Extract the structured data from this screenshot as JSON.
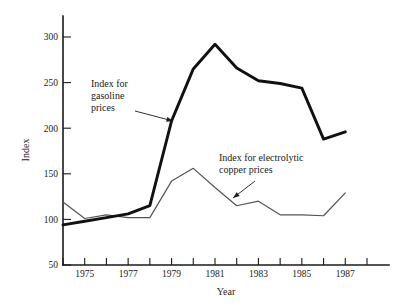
{
  "chart_data": {
    "type": "line",
    "title": "",
    "xlabel": "Year",
    "ylabel": "Index",
    "xlim": [
      1974,
      1988
    ],
    "ylim": [
      50,
      300
    ],
    "grid": false,
    "legend_position": "inline-annotations",
    "x": [
      1974,
      1975,
      1976,
      1977,
      1978,
      1979,
      1980,
      1981,
      1982,
      1983,
      1984,
      1985,
      1986,
      1987
    ],
    "xtick_values": [
      1974,
      1975,
      1976,
      1977,
      1978,
      1979,
      1980,
      1981,
      1982,
      1983,
      1984,
      1985,
      1986,
      1987,
      1988
    ],
    "xtick_labels": [
      "",
      "1975",
      "",
      "1977",
      "",
      "1979",
      "",
      "1981",
      "",
      "1983",
      "",
      "1985",
      "",
      "1987",
      ""
    ],
    "ytick_values": [
      50,
      100,
      150,
      200,
      250,
      300
    ],
    "ytick_labels": [
      "50",
      "100",
      "150",
      "200",
      "250",
      "300"
    ],
    "series": [
      {
        "name": "Index for gasoline prices",
        "color": "#111111",
        "linewidth": 2.9,
        "values": [
          94,
          98,
          102,
          106,
          115,
          208,
          265,
          292,
          266,
          252,
          249,
          244,
          188,
          196
        ]
      },
      {
        "name": "Index for electrolytic copper prices",
        "color": "#545454",
        "linewidth": 1.2,
        "values": [
          119,
          101,
          105,
          102,
          102,
          142,
          156,
          135,
          115,
          120,
          105,
          105,
          104,
          129
        ]
      }
    ],
    "annotations": [
      {
        "id": "gasoline-annotation",
        "lines": [
          "Index for",
          "gasoline",
          "prices"
        ],
        "text": "Index for gasoline prices",
        "text_x": 91,
        "text_y": 87,
        "arrow_from_x": 135,
        "arrow_from_y": 111,
        "arrow_to_x": 173,
        "arrow_to_y": 121
      },
      {
        "id": "copper-annotation",
        "lines": [
          "Index for electrolytic",
          "copper prices"
        ],
        "text": "Index for electrolytic copper prices",
        "text_x": 219,
        "text_y": 161,
        "arrow_from_x": 255,
        "arrow_from_y": 181,
        "arrow_to_x": 233,
        "arrow_to_y": 198
      }
    ]
  },
  "axes": {
    "x_title": "Year",
    "y_title": "Index"
  }
}
